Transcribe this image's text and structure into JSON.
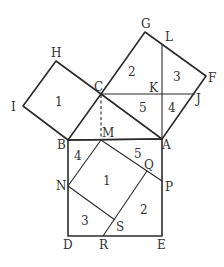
{
  "diagram": {
    "points": {
      "A": {
        "label": "A",
        "x": 162,
        "y": 139
      },
      "B": {
        "label": "B",
        "x": 68,
        "y": 140
      },
      "C": {
        "label": "C",
        "x": 101,
        "y": 94
      },
      "D": {
        "label": "D",
        "x": 68,
        "y": 236
      },
      "E": {
        "label": "E",
        "x": 162,
        "y": 236
      },
      "F": {
        "label": "F",
        "x": 206,
        "y": 76
      },
      "G": {
        "label": "G",
        "x": 145,
        "y": 32
      },
      "H": {
        "label": "H",
        "x": 56,
        "y": 61
      },
      "I": {
        "label": "I",
        "x": 23,
        "y": 106
      },
      "J": {
        "label": "J",
        "x": 195,
        "y": 94
      },
      "K": {
        "label": "K",
        "x": 162,
        "y": 94
      },
      "L": {
        "label": "L",
        "x": 162,
        "y": 44
      },
      "M": {
        "label": "M",
        "x": 101,
        "y": 140
      },
      "N": {
        "label": "N",
        "x": 68,
        "y": 186
      },
      "P": {
        "label": "P",
        "x": 162,
        "y": 181
      },
      "Q": {
        "label": "Q",
        "x": 147,
        "y": 171
      },
      "R": {
        "label": "R",
        "x": 103,
        "y": 236
      },
      "S": {
        "label": "S",
        "x": 115,
        "y": 220
      }
    },
    "regions": {
      "small_square_1": "1",
      "big_square_2": "2",
      "big_square_3": "3",
      "big_square_4": "4",
      "big_square_5": "5",
      "hyp_square_1": "1",
      "hyp_square_2": "2",
      "hyp_square_3": "3",
      "hyp_square_4": "4",
      "hyp_square_5": "5"
    }
  }
}
